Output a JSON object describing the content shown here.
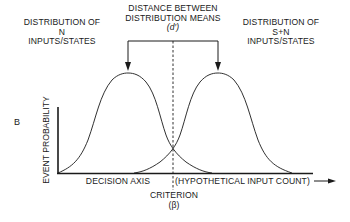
{
  "figure": {
    "panel_letter": "B",
    "title": {
      "line1": "DISTANCE BETWEEN",
      "line2": "DISTRIBUTION MEANS",
      "symbol": "(d′)"
    },
    "left_distribution": {
      "line1": "DISTRIBUTION OF",
      "line2": "N",
      "line3": "INPUTS/STATES"
    },
    "right_distribution": {
      "line1": "DISTRIBUTION OF",
      "line2": "S+N",
      "line3": "INPUTS/STATES"
    },
    "y_axis_label": "EVENT PROBABILITY",
    "x_axis_left_label": "DECISION AXIS",
    "x_axis_right_label": "(HYPOTHETICAL INPUT COUNT)",
    "criterion": {
      "label": "CRITERION",
      "symbol": "(β)"
    }
  },
  "colors": {
    "ink": "#1a1a1a",
    "background": "#ffffff"
  }
}
